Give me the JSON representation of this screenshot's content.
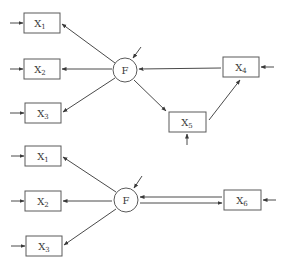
{
  "diagram": {
    "type": "path-diagram",
    "colors": {
      "stroke": "#4a4a4a",
      "text": "#3a3a3a",
      "background": "#ffffff"
    },
    "top_model": {
      "factor": {
        "label": "F"
      },
      "indicators": [
        {
          "id": "x1",
          "base": "X",
          "sub": "1"
        },
        {
          "id": "x2",
          "base": "X",
          "sub": "2"
        },
        {
          "id": "x3",
          "base": "X",
          "sub": "3"
        },
        {
          "id": "x4",
          "base": "X",
          "sub": "4"
        },
        {
          "id": "x5",
          "base": "X",
          "sub": "5"
        }
      ],
      "edges": [
        {
          "from": "F",
          "to": "X1"
        },
        {
          "from": "F",
          "to": "X2"
        },
        {
          "from": "F",
          "to": "X3"
        },
        {
          "from": "X4",
          "to": "F"
        },
        {
          "from": "F",
          "to": "X5"
        },
        {
          "from": "X5",
          "to": "X4"
        }
      ]
    },
    "bottom_model": {
      "factor": {
        "label": "F"
      },
      "indicators": [
        {
          "id": "x1",
          "base": "X",
          "sub": "1"
        },
        {
          "id": "x2",
          "base": "X",
          "sub": "2"
        },
        {
          "id": "x3",
          "base": "X",
          "sub": "3"
        },
        {
          "id": "x6",
          "base": "X",
          "sub": "6"
        }
      ],
      "edges": [
        {
          "from": "F",
          "to": "X1"
        },
        {
          "from": "F",
          "to": "X2"
        },
        {
          "from": "F",
          "to": "X3"
        },
        {
          "from": "X6",
          "to": "F"
        },
        {
          "from": "F",
          "to": "X6"
        }
      ]
    }
  }
}
